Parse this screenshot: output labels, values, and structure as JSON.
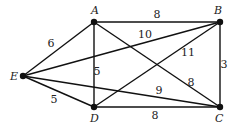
{
  "diagram": {
    "type": "weighted-undirected-graph",
    "vertices": [
      {
        "id": "A",
        "label": "A",
        "x": 94,
        "y": 22,
        "lx": 91,
        "ly": 14
      },
      {
        "id": "B",
        "label": "B",
        "x": 220,
        "y": 22,
        "lx": 214,
        "ly": 14
      },
      {
        "id": "C",
        "label": "C",
        "x": 220,
        "y": 107,
        "lx": 215,
        "ly": 122
      },
      {
        "id": "D",
        "label": "D",
        "x": 94,
        "y": 107,
        "lx": 90,
        "ly": 122
      },
      {
        "id": "E",
        "label": "E",
        "x": 23,
        "y": 76,
        "lx": 10,
        "ly": 80
      }
    ],
    "edges": [
      {
        "from": "A",
        "to": "B",
        "weight": "8",
        "lx": 157,
        "ly": 18
      },
      {
        "from": "A",
        "to": "E",
        "weight": "6",
        "lx": 51,
        "ly": 47
      },
      {
        "from": "A",
        "to": "D",
        "weight": "5",
        "lx": 97,
        "ly": 75
      },
      {
        "from": "A",
        "to": "C",
        "weight": "8",
        "lx": 191,
        "ly": 86
      },
      {
        "from": "E",
        "to": "B",
        "weight": "10",
        "lx": 145,
        "ly": 38
      },
      {
        "from": "D",
        "to": "B",
        "weight": "11",
        "lx": 188,
        "ly": 56
      },
      {
        "from": "B",
        "to": "C",
        "weight": "3",
        "lx": 224,
        "ly": 68
      },
      {
        "from": "E",
        "to": "C",
        "weight": "9",
        "lx": 159,
        "ly": 94
      },
      {
        "from": "E",
        "to": "D",
        "weight": "5",
        "lx": 54,
        "ly": 103
      },
      {
        "from": "D",
        "to": "C",
        "weight": "8",
        "lx": 155,
        "ly": 119
      }
    ]
  }
}
